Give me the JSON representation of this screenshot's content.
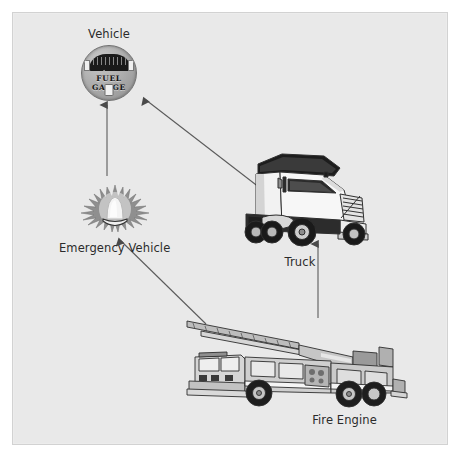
{
  "diagram": {
    "type": "inheritance-hierarchy",
    "title": "",
    "background_color": "#e9e9e9",
    "frame_border_color": "#d2d2d2",
    "page_color": "#ffffff",
    "edge_color": "#555555",
    "nodes": [
      {
        "id": "vehicle",
        "label": "Vehicle",
        "icon": "fuel-gauge-icon",
        "icon_text": "FUEL GAUGE",
        "label_position": "above"
      },
      {
        "id": "emergency-vehicle",
        "label": "Emergency Vehicle",
        "icon": "emergency-beacon-light-icon",
        "label_position": "below"
      },
      {
        "id": "truck",
        "label": "Truck",
        "icon": "semi-truck-icon",
        "label_position": "below"
      },
      {
        "id": "fire-engine",
        "label": "Fire Engine",
        "icon": "ladder-fire-truck-icon",
        "label_position": "below"
      }
    ],
    "edges": [
      {
        "from": "emergency-vehicle",
        "to": "vehicle",
        "style": "solid",
        "arrow": "filled-triangle"
      },
      {
        "from": "truck",
        "to": "vehicle",
        "style": "solid",
        "arrow": "filled-triangle"
      },
      {
        "from": "fire-engine",
        "to": "emergency-vehicle",
        "style": "solid",
        "arrow": "filled-triangle"
      },
      {
        "from": "fire-engine",
        "to": "truck",
        "style": "solid",
        "arrow": "filled-triangle"
      }
    ]
  }
}
